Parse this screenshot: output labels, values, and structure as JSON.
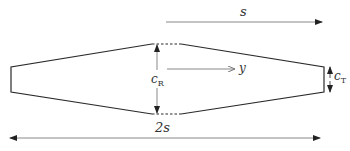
{
  "diagram": {
    "colors": {
      "outline": "#2a2a2a",
      "dimension": "#777777",
      "text": "#333333",
      "background": "#ffffff"
    },
    "labels": {
      "semi_span": "s",
      "full_span": "2s",
      "root_chord_main": "c",
      "root_chord_sub": "R",
      "tip_chord_main": "c",
      "tip_chord_sub": "T",
      "spanwise_axis": "y"
    },
    "geometry": {
      "left_tip_x": 11,
      "right_tip_x": 324,
      "tip_top_y": 67,
      "tip_bottom_y": 92,
      "root_left_x": 152,
      "root_right_x": 181,
      "root_top_y": 44,
      "root_bottom_y": 114
    }
  }
}
